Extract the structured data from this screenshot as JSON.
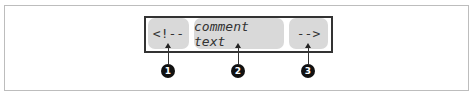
{
  "diagram": {
    "tokens": [
      {
        "text": "<!--",
        "style": "normal",
        "callout": "1"
      },
      {
        "text": "comment text",
        "style": "italic",
        "callout": "2"
      },
      {
        "text": "-->",
        "style": "normal",
        "callout": "3"
      }
    ],
    "colors": {
      "token_fill": "#d9d9d9",
      "box_border": "#333333",
      "frame_border": "#bdbdbd",
      "callout_fill": "#111111"
    }
  }
}
